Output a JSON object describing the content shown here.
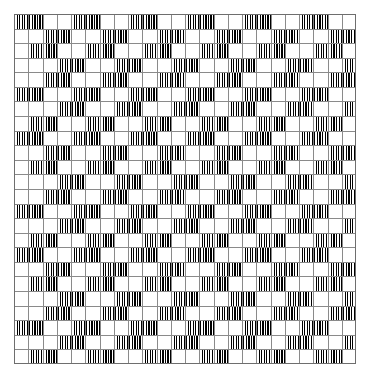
{
  "figure": {
    "title": "Twisted cord grid illusion",
    "type": "optical-illusion-pattern",
    "caption": "",
    "canvas": {
      "width": 370,
      "height": 381,
      "background": "#ffffff"
    },
    "plot_area": {
      "x": 14,
      "y": 14,
      "width": 342,
      "height": 350
    },
    "grid": {
      "columns": 24,
      "rows": 24,
      "cell_width": 14.25,
      "cell_height": 14.583,
      "line_color": "#8a8a8a",
      "line_width_px": 1,
      "border_color": "#6e6e6e",
      "visible": true
    },
    "texture": {
      "name": "vertical-stripes",
      "stripe_color": "#000000",
      "gap_color": "#ffffff",
      "stripe_width_px": 1.15,
      "period_px": 2.55,
      "block_width_cells": 2,
      "block_height_cells": 1
    },
    "pattern": {
      "description": "Rows of 2-cell-wide striped blocks separated by 2-cell white gaps; each successive row shifts the block phase, producing an offset checker texture.",
      "period_cells": 4,
      "row_phase_sequence": [
        0,
        2,
        1,
        3,
        2,
        0,
        3,
        1
      ],
      "filled_fraction": 0.5
    },
    "rows": [
      {
        "index": 0,
        "offset": 0,
        "blocks": [
          0,
          4,
          8,
          12,
          16,
          20
        ]
      },
      {
        "index": 1,
        "offset": 2,
        "blocks": [
          2,
          6,
          10,
          14,
          18,
          22
        ]
      },
      {
        "index": 2,
        "offset": 1,
        "blocks": [
          1,
          5,
          9,
          13,
          17,
          21
        ]
      },
      {
        "index": 3,
        "offset": 3,
        "blocks": [
          3,
          7,
          11,
          15,
          19,
          23
        ]
      },
      {
        "index": 4,
        "offset": 2,
        "blocks": [
          2,
          6,
          10,
          14,
          18,
          22
        ]
      },
      {
        "index": 5,
        "offset": 0,
        "blocks": [
          0,
          4,
          8,
          12,
          16,
          20
        ]
      },
      {
        "index": 6,
        "offset": 3,
        "blocks": [
          3,
          7,
          11,
          15,
          19,
          23
        ]
      },
      {
        "index": 7,
        "offset": 1,
        "blocks": [
          1,
          5,
          9,
          13,
          17,
          21
        ]
      },
      {
        "index": 8,
        "offset": 0,
        "blocks": [
          0,
          4,
          8,
          12,
          16,
          20
        ]
      },
      {
        "index": 9,
        "offset": 2,
        "blocks": [
          2,
          6,
          10,
          14,
          18,
          22
        ]
      },
      {
        "index": 10,
        "offset": 1,
        "blocks": [
          1,
          5,
          9,
          13,
          17,
          21
        ]
      },
      {
        "index": 11,
        "offset": 3,
        "blocks": [
          3,
          7,
          11,
          15,
          19,
          23
        ]
      },
      {
        "index": 12,
        "offset": 2,
        "blocks": [
          2,
          6,
          10,
          14,
          18,
          22
        ]
      },
      {
        "index": 13,
        "offset": 0,
        "blocks": [
          0,
          4,
          8,
          12,
          16,
          20
        ]
      },
      {
        "index": 14,
        "offset": 3,
        "blocks": [
          3,
          7,
          11,
          15,
          19,
          23
        ]
      },
      {
        "index": 15,
        "offset": 1,
        "blocks": [
          1,
          5,
          9,
          13,
          17,
          21
        ]
      },
      {
        "index": 16,
        "offset": 0,
        "blocks": [
          0,
          4,
          8,
          12,
          16,
          20
        ]
      },
      {
        "index": 17,
        "offset": 2,
        "blocks": [
          2,
          6,
          10,
          14,
          18,
          22
        ]
      },
      {
        "index": 18,
        "offset": 1,
        "blocks": [
          1,
          5,
          9,
          13,
          17,
          21
        ]
      },
      {
        "index": 19,
        "offset": 3,
        "blocks": [
          3,
          7,
          11,
          15,
          19,
          23
        ]
      },
      {
        "index": 20,
        "offset": 2,
        "blocks": [
          2,
          6,
          10,
          14,
          18,
          22
        ]
      },
      {
        "index": 21,
        "offset": 0,
        "blocks": [
          0,
          4,
          8,
          12,
          16,
          20
        ]
      },
      {
        "index": 22,
        "offset": 3,
        "blocks": [
          3,
          7,
          11,
          15,
          19,
          23
        ]
      },
      {
        "index": 23,
        "offset": 1,
        "blocks": [
          1,
          5,
          9,
          13,
          17,
          21
        ]
      }
    ]
  }
}
